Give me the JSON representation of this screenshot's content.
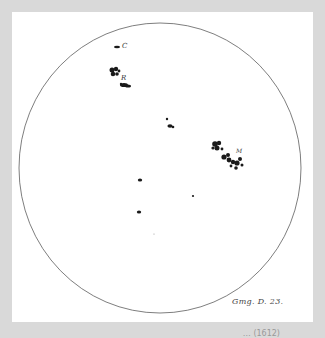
{
  "figure": {
    "plate_label": "Gmg. D. 23.",
    "spot_labels": {
      "c": "C",
      "r": "R",
      "m": "M"
    },
    "caption_truncated": "… (1612)"
  },
  "colors": {
    "background": "#d9d9d9",
    "panel": "#ffffff",
    "ink": "#1a1a1a",
    "outline": "#555555"
  }
}
